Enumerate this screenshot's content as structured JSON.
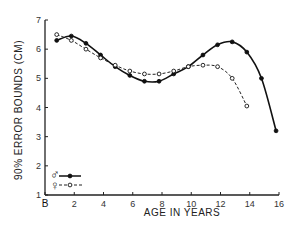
{
  "chart_data": {
    "type": "line",
    "title": "",
    "xlabel": "AGE IN YEARS",
    "ylabel": "90% ERROR BOUNDS (CM)",
    "xlim": [
      0,
      16
    ],
    "ylim": [
      1,
      7
    ],
    "grid": false,
    "x_tick_labels": [
      "B",
      "2",
      "4",
      "6",
      "8",
      "10",
      "12",
      "14",
      "16"
    ],
    "x_ticks": [
      0,
      2,
      4,
      6,
      8,
      10,
      12,
      14,
      16
    ],
    "y_ticks": [
      1,
      2,
      3,
      4,
      5,
      6,
      7
    ],
    "y_tick_labels": [
      "1",
      "2",
      "3",
      "4",
      "5",
      "6",
      "7"
    ],
    "legend_position": "lower-left",
    "series": [
      {
        "name": "Male (♂)",
        "style": "solid line, filled circles",
        "x": [
          0.8,
          1.8,
          2.8,
          3.8,
          4.8,
          5.8,
          6.8,
          7.8,
          8.8,
          9.8,
          10.8,
          11.8,
          12.8,
          13.8,
          14.8,
          15.8
        ],
        "values": [
          6.3,
          6.45,
          6.2,
          5.8,
          5.4,
          5.1,
          4.9,
          4.9,
          5.15,
          5.4,
          5.8,
          6.15,
          6.25,
          5.9,
          5.0,
          3.2
        ]
      },
      {
        "name": "Female (♀)",
        "style": "dashed line, open circles",
        "x": [
          0.8,
          1.8,
          2.8,
          3.8,
          4.8,
          5.8,
          6.8,
          7.8,
          8.8,
          9.8,
          10.8,
          11.8,
          12.8,
          13.8
        ],
        "values": [
          6.5,
          6.3,
          6.0,
          5.7,
          5.45,
          5.25,
          5.15,
          5.15,
          5.25,
          5.4,
          5.45,
          5.4,
          5.0,
          4.05
        ]
      }
    ]
  },
  "legend": {
    "male_symbol": "♂",
    "female_symbol": "♀"
  }
}
